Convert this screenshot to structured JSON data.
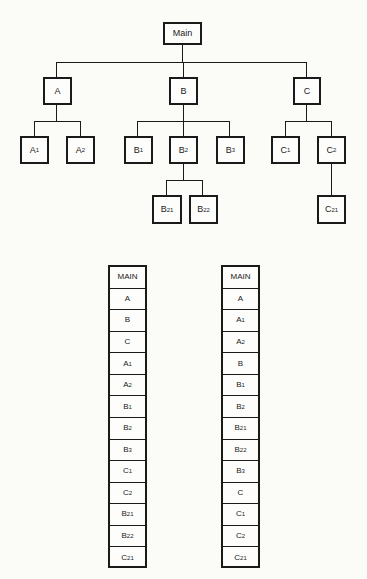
{
  "tree": {
    "root": {
      "label": "Main",
      "sub": ""
    },
    "level1": [
      {
        "label": "A",
        "sub": ""
      },
      {
        "label": "B",
        "sub": ""
      },
      {
        "label": "C",
        "sub": ""
      }
    ],
    "level2": [
      {
        "label": "A",
        "sub": "1"
      },
      {
        "label": "A",
        "sub": "2"
      },
      {
        "label": "B",
        "sub": "1"
      },
      {
        "label": "B",
        "sub": "2"
      },
      {
        "label": "B",
        "sub": "3"
      },
      {
        "label": "C",
        "sub": "1"
      },
      {
        "label": "C",
        "sub": "2"
      }
    ],
    "level3": [
      {
        "label": "B",
        "sub": "21"
      },
      {
        "label": "B",
        "sub": "22"
      },
      {
        "label": "C",
        "sub": "21"
      }
    ]
  },
  "lists": {
    "breadth_first": [
      {
        "label": "MAIN",
        "sub": ""
      },
      {
        "label": "A",
        "sub": ""
      },
      {
        "label": "B",
        "sub": ""
      },
      {
        "label": "C",
        "sub": ""
      },
      {
        "label": "A",
        "sub": "1"
      },
      {
        "label": "A",
        "sub": "2"
      },
      {
        "label": "B",
        "sub": "1"
      },
      {
        "label": "B",
        "sub": "2"
      },
      {
        "label": "B",
        "sub": "3"
      },
      {
        "label": "C",
        "sub": "1"
      },
      {
        "label": "C",
        "sub": "2"
      },
      {
        "label": "B",
        "sub": "21"
      },
      {
        "label": "B",
        "sub": "22"
      },
      {
        "label": "C",
        "sub": "21"
      }
    ],
    "depth_first": [
      {
        "label": "MAIN",
        "sub": ""
      },
      {
        "label": "A",
        "sub": ""
      },
      {
        "label": "A",
        "sub": "1"
      },
      {
        "label": "A",
        "sub": "2"
      },
      {
        "label": "B",
        "sub": ""
      },
      {
        "label": "B",
        "sub": "1"
      },
      {
        "label": "B",
        "sub": "2"
      },
      {
        "label": "B",
        "sub": "21"
      },
      {
        "label": "B",
        "sub": "22"
      },
      {
        "label": "B",
        "sub": "3"
      },
      {
        "label": "C",
        "sub": ""
      },
      {
        "label": "C",
        "sub": "1"
      },
      {
        "label": "C",
        "sub": "2"
      },
      {
        "label": "C",
        "sub": "21"
      }
    ]
  },
  "colors": {
    "ink": "#1a1a1a",
    "paper": "#fbfbf8"
  }
}
